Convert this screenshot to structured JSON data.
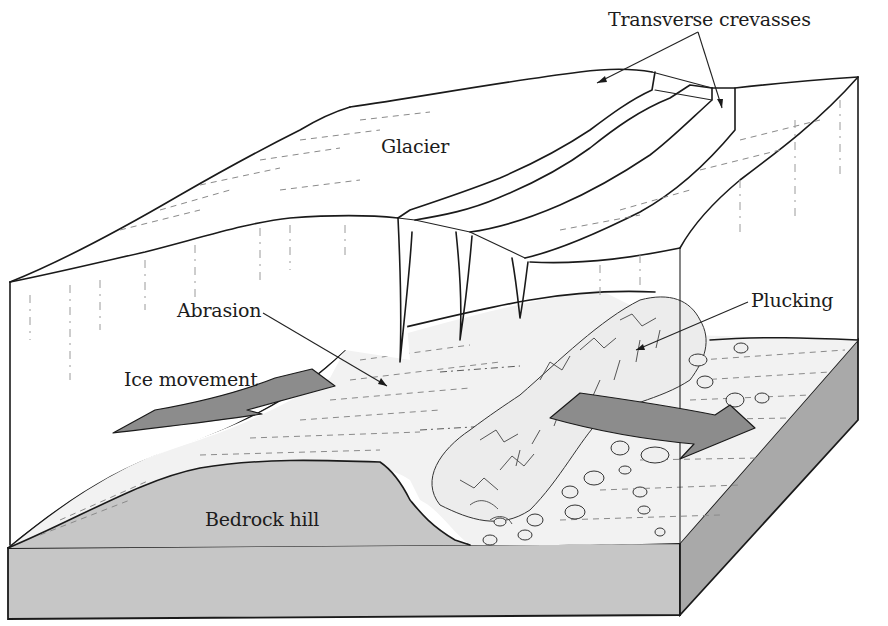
{
  "diagram": {
    "labels": {
      "transverse_crevasses": "Transverse crevasses",
      "glacier": "Glacier",
      "abrasion": "Abrasion",
      "plucking": "Plucking",
      "ice_movement": "Ice movement",
      "bedrock_hill": "Bedrock hill"
    },
    "colors": {
      "background": "#ffffff",
      "ice": "#ffffff",
      "bedrock_surface": "#f2f2f2",
      "bedrock_front": "#c6c6c6",
      "bedrock_side": "#a9a9a9",
      "arrow_fill": "#8c8c8c",
      "line": "#1a1a1a"
    }
  }
}
